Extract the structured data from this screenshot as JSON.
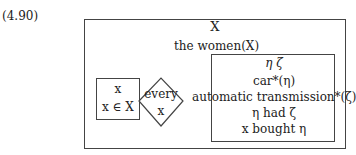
{
  "example_number": "(4.90)",
  "outer_box": {
    "discourse_referent": "X",
    "condition": "the women(X)"
  },
  "restrictor_box": {
    "discourse_referent": "x",
    "condition": "x ∈ X"
  },
  "quantifier": {
    "determiner": "every",
    "variable": "x"
  },
  "scope_box": {
    "discourse_referents": "η  ζ",
    "conditions": [
      "car*(η)",
      "automatic transmission*(ζ)",
      "η had ζ",
      "x bought η"
    ]
  }
}
